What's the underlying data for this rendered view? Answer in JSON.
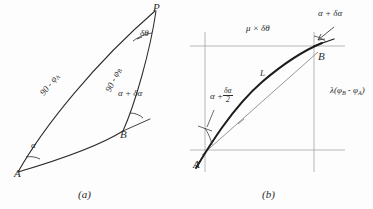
{
  "figure": {
    "type": "hand-drawn-geometry-diagram",
    "background_color": "#fdfdfd",
    "ink_color": "#2b2b2b",
    "panels": [
      {
        "id": "a",
        "caption": "(a)",
        "description": "Spherical triangle A-B-P formed by two great-circle arcs meeting at pole P",
        "points": [
          {
            "name": "A",
            "label": "A",
            "x": 18,
            "y": 172
          },
          {
            "name": "B",
            "label": "B",
            "x": 122,
            "y": 130
          },
          {
            "name": "P",
            "label": "P",
            "x": 155,
            "y": 10
          }
        ],
        "labels": [
          {
            "name": "arc-AP-label",
            "text": "90 - φ",
            "sub": "A",
            "x": 48,
            "y": 92
          },
          {
            "name": "arc-BP-label",
            "text": "90 - φ",
            "sub": "B",
            "x": 115,
            "y": 88
          },
          {
            "name": "angle-delta-theta",
            "text": "δθ",
            "x": 140,
            "y": 34
          },
          {
            "name": "angle-alpha-plus-delta-alpha",
            "text": "α + δα",
            "x": 118,
            "y": 94
          },
          {
            "name": "angle-alpha",
            "text": "α",
            "x": 32,
            "y": 146
          }
        ]
      },
      {
        "id": "b",
        "caption": "(b)",
        "description": "Plane right-triangle construction showing departure and meridional parts between A and B",
        "points": [
          {
            "name": "A",
            "label": "A",
            "x": 199,
            "y": 163
          },
          {
            "name": "B",
            "label": "B",
            "x": 320,
            "y": 60
          }
        ],
        "labels": [
          {
            "name": "departure-label",
            "text": "μ × δθ",
            "x": 248,
            "y": 29
          },
          {
            "name": "angle-course-at-B",
            "text": "α + δα",
            "x": 320,
            "y": 14
          },
          {
            "name": "meridional-parts-label",
            "text": "λ(φ",
            "sub1": "B",
            "mid": " - φ",
            "sub2": "A",
            "tail": ")",
            "x": 333,
            "y": 92
          },
          {
            "name": "mean-course-label-prefix",
            "text": "α +",
            "numerator": "δα",
            "denominator": "2",
            "x": 212,
            "y": 92
          },
          {
            "name": "rhumb-length-label",
            "text": "L",
            "x": 262,
            "y": 74
          }
        ]
      }
    ]
  }
}
